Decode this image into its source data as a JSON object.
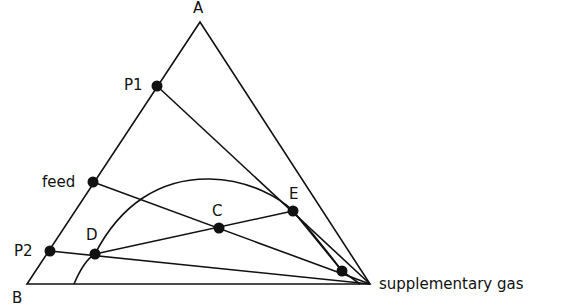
{
  "diagram": {
    "type": "ternary-phase-diagram",
    "vertices": {
      "top": {
        "label": "A",
        "x": 200,
        "y": 22
      },
      "bottom_left": {
        "label": "B",
        "x": 27,
        "y": 284
      },
      "bottom_right": {
        "label": "supplementary gas",
        "x": 370,
        "y": 284
      }
    },
    "points": [
      {
        "id": "P1",
        "label": "P1",
        "x": 157,
        "y": 86,
        "lx": 124,
        "ly": 90
      },
      {
        "id": "feed",
        "label": "feed",
        "x": 93,
        "y": 182,
        "lx": 42,
        "ly": 187
      },
      {
        "id": "P2",
        "label": "P2",
        "x": 50,
        "y": 251,
        "lx": 14,
        "ly": 254
      },
      {
        "id": "D",
        "label": "D",
        "x": 95,
        "y": 254,
        "lx": 86,
        "ly": 240
      },
      {
        "id": "C",
        "label": "C",
        "x": 219,
        "y": 228,
        "lx": 212,
        "ly": 215
      },
      {
        "id": "E",
        "label": "E",
        "x": 293,
        "y": 211,
        "lx": 290,
        "ly": 198
      },
      {
        "id": "R",
        "label": "",
        "x": 342,
        "y": 271,
        "lx": 0,
        "ly": 0
      }
    ],
    "line_color": "#111111"
  }
}
